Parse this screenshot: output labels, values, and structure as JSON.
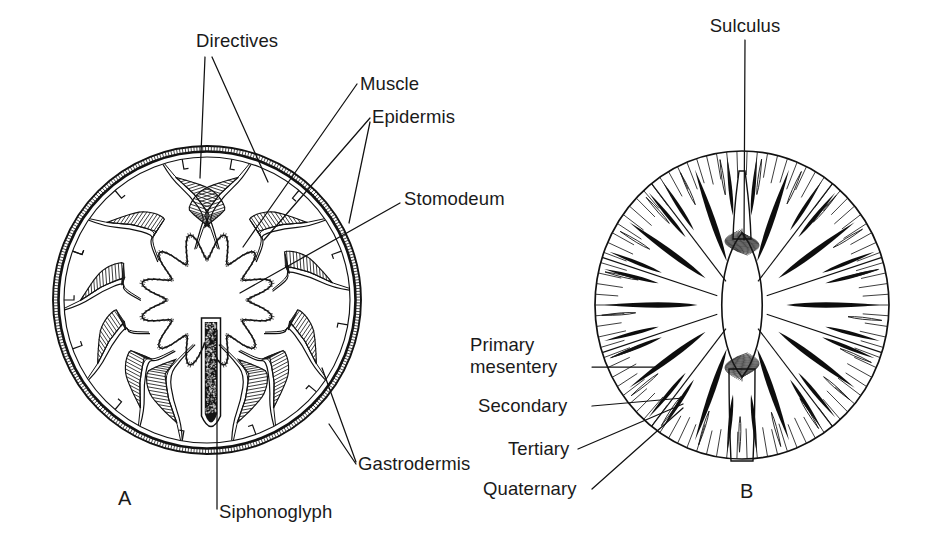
{
  "figure": {
    "caption_absent": true,
    "background_color": "#ffffff",
    "ink_color": "#111111",
    "width": 929,
    "height": 555
  },
  "panels": [
    {
      "id": "A",
      "letter": "A",
      "letter_x": 118,
      "letter_y": 505,
      "subject": "sea-anemone-cross-section",
      "center_x": 207,
      "center_y": 300,
      "radius_x": 155,
      "radius_y": 155
    },
    {
      "id": "B",
      "letter": "B",
      "letter_x": 740,
      "letter_y": 498,
      "subject": "mesentery-arrangement-cross-section",
      "center_x": 742,
      "center_y": 305,
      "radius_x": 148,
      "radius_y": 155
    }
  ],
  "labels": {
    "directives": {
      "text": "Directives",
      "x": 196,
      "y": 47,
      "anchor": "start",
      "panel": "A"
    },
    "muscle": {
      "text": "Muscle",
      "x": 360,
      "y": 90,
      "anchor": "start",
      "panel": "A"
    },
    "epidermis": {
      "text": "Epidermis",
      "x": 372,
      "y": 123,
      "anchor": "start",
      "panel": "A"
    },
    "stomodeum": {
      "text": "Stomodeum",
      "x": 404,
      "y": 205,
      "anchor": "start",
      "panel": "A"
    },
    "gastrodermis": {
      "text": "Gastrodermis",
      "x": 358,
      "y": 470,
      "anchor": "start",
      "panel": "A"
    },
    "siphonoglyph": {
      "text": "Siphonoglyph",
      "x": 219,
      "y": 518,
      "anchor": "start",
      "panel": "A"
    },
    "sulculus": {
      "text": "Sulculus",
      "x": 745,
      "y": 32,
      "anchor": "middle",
      "panel": "B"
    },
    "primary_mesentery_line1": {
      "text": "Primary",
      "x": 470,
      "y": 351,
      "anchor": "start",
      "panel": "B"
    },
    "primary_mesentery_line2": {
      "text": "mesentery",
      "x": 470,
      "y": 373,
      "anchor": "start",
      "panel": "B"
    },
    "secondary": {
      "text": "Secondary",
      "x": 478,
      "y": 412,
      "anchor": "start",
      "panel": "B"
    },
    "tertiary": {
      "text": "Tertiary",
      "x": 508,
      "y": 455,
      "anchor": "start",
      "panel": "B"
    },
    "quaternary": {
      "text": "Quaternary",
      "x": 483,
      "y": 495,
      "anchor": "start",
      "panel": "B"
    }
  },
  "leader_lines": {
    "directives_left": "M 205 57 L 200 178",
    "directives_right": "M 212 57 L 268 182",
    "muscle": "M 357 84 L 243 247",
    "epidermis_upper": "M 370 118 L 264 240",
    "epidermis_lower": "M 370 122 L 349 223",
    "stomodeum": "M 400 203 L 240 293",
    "gastrodermis_upper": "M 356 462 L 322 368",
    "gastrodermis_lower": "M 356 464 L 329 424",
    "siphonoglyph": "M 217 509 L 217 330",
    "sulculus": "M 745 40 L 744 240",
    "primary_mesentery": "M 592 367 L 659 367",
    "secondary": "M 592 406 L 683 398",
    "tertiary": "M 578 449 L 683 404",
    "quaternary": "M 592 489 L 683 408"
  },
  "anatomy_A": {
    "structure_names": [
      "body-wall-epidermis",
      "body-wall-gastrodermis",
      "mesentery",
      "retractor-muscle",
      "stomodeum",
      "siphonoglyph",
      "directive-mesentery"
    ],
    "mesentery_count": 12,
    "directive_pair_count": 2,
    "siphonoglyph_count": 1
  },
  "anatomy_B": {
    "structure_names": [
      "sulculus",
      "primary-mesentery",
      "secondary-mesentery",
      "tertiary-mesentery",
      "quaternary-mesentery"
    ],
    "primary_count": 6,
    "secondary_count": 6,
    "tertiary_count": 12,
    "quaternary_count": 24
  }
}
